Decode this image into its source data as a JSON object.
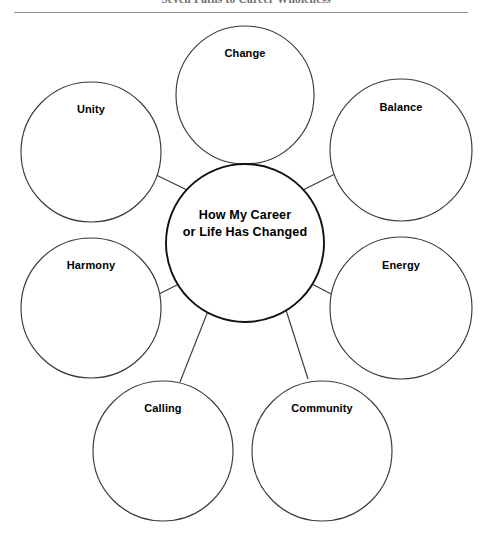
{
  "document": {
    "title": "Seven Paths to Career Wholeness",
    "title_clipped": true
  },
  "diagram": {
    "type": "bubble-map",
    "center": {
      "id": "center-bubble",
      "label_lines": [
        "How My Career",
        "or Life Has Changed"
      ],
      "line1": "How My Career",
      "line2": "or Life Has Changed",
      "cx": 245,
      "cy": 227,
      "r": 79,
      "stroke": "#111111"
    },
    "satellites": [
      {
        "id": "change",
        "label": "Change",
        "cx": 245,
        "cy": 79,
        "r": 69,
        "label_dy": -38,
        "stroke": "#3a3a3a"
      },
      {
        "id": "balance",
        "label": "Balance",
        "cx": 401,
        "cy": 134,
        "r": 71,
        "label_dy": -39,
        "stroke": "#3a3a3a"
      },
      {
        "id": "energy",
        "label": "Energy",
        "cx": 401,
        "cy": 292,
        "r": 71,
        "label_dy": -39,
        "stroke": "#3a3a3a"
      },
      {
        "id": "community",
        "label": "Community",
        "cx": 322,
        "cy": 435,
        "r": 70,
        "label_dy": -39,
        "stroke": "#3a3a3a"
      },
      {
        "id": "calling",
        "label": "Calling",
        "cx": 163,
        "cy": 435,
        "r": 70,
        "label_dy": -39,
        "stroke": "#3a3a3a"
      },
      {
        "id": "harmony",
        "label": "Harmony",
        "cx": 91,
        "cy": 292,
        "r": 70,
        "label_dy": -39,
        "stroke": "#3a3a3a"
      },
      {
        "id": "unity",
        "label": "Unity",
        "cx": 91,
        "cy": 136,
        "r": 70,
        "label_dy": -39,
        "stroke": "#3a3a3a"
      }
    ],
    "connectors": [
      {
        "id": "connector-change",
        "from": "center",
        "to": "change",
        "x1": 245,
        "y1": 148,
        "x2": 245,
        "y2": 163
      },
      {
        "id": "connector-balance",
        "from": "center",
        "to": "balance",
        "x1": 303,
        "y1": 174,
        "x2": 341,
        "y2": 155
      },
      {
        "id": "connector-energy",
        "from": "center",
        "to": "energy",
        "x1": 310,
        "y1": 267,
        "x2": 337,
        "y2": 281
      },
      {
        "id": "connector-community",
        "from": "center",
        "to": "community",
        "x1": 286,
        "y1": 294,
        "x2": 308,
        "y2": 363
      },
      {
        "id": "connector-calling",
        "from": "center",
        "to": "calling",
        "x1": 208,
        "y1": 295,
        "x2": 180,
        "y2": 366
      },
      {
        "id": "connector-harmony",
        "from": "center",
        "to": "harmony",
        "x1": 181,
        "y1": 267,
        "x2": 153,
        "y2": 281
      },
      {
        "id": "connector-unity",
        "from": "center",
        "to": "unity",
        "x1": 187,
        "y1": 174,
        "x2": 150,
        "y2": 156
      }
    ]
  }
}
